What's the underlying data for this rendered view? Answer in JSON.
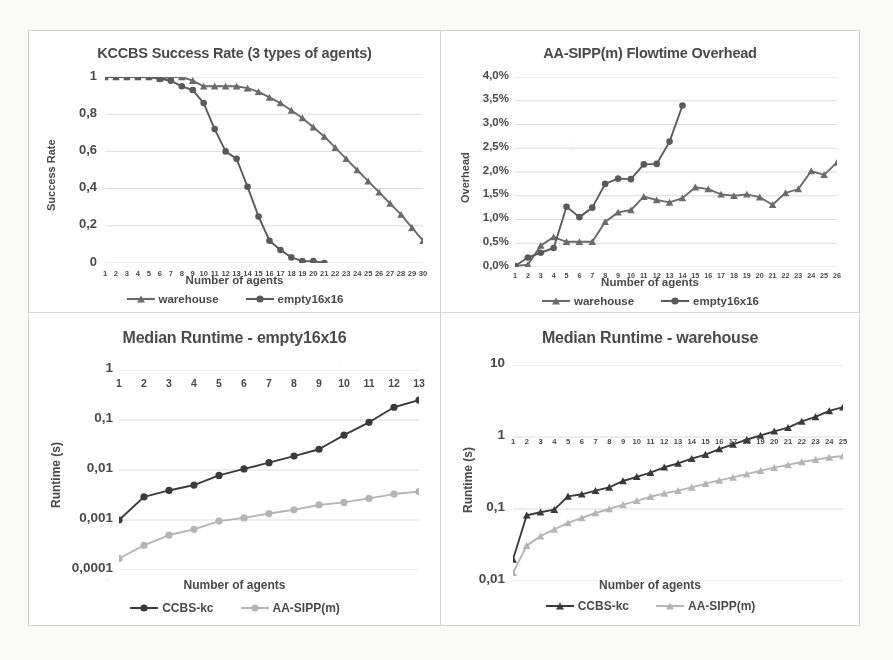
{
  "figure": {
    "background": "#fbfbfa",
    "panel_background": "#ffffff",
    "border_color": "#d2d2d2",
    "text_color": "#4a4a4a"
  },
  "series_colors": {
    "warehouse": "#6b6b6b",
    "empty16x16": "#5a5a5a",
    "ccbs_kc": "#3a3a3a",
    "aa_sipp_m": "#b5b5b5"
  },
  "charts": [
    {
      "id": "kccbs-success-rate",
      "title": "KCCBS Success Rate (3 types of agents)",
      "xlabel": "Number of agents",
      "ylabel": "Success Rate"
    },
    {
      "id": "aasipp-flowtime-overhead",
      "title": "AA-SIPP(m) Flowtime Overhead",
      "xlabel": "Number of agents",
      "ylabel": "Overhead"
    },
    {
      "id": "median-runtime-empty",
      "title": "Median Runtime - empty16x16",
      "xlabel": "Number of agents",
      "ylabel": "Runtime (s)"
    },
    {
      "id": "median-runtime-warehouse",
      "title": "Median Runtime - warehouse",
      "xlabel": "Number of agents",
      "ylabel": "Runtime (s)"
    }
  ],
  "chart_data": [
    {
      "type": "line",
      "id": "kccbs-success-rate",
      "title": "KCCBS Success Rate (3 types of agents)",
      "xlabel": "Number of agents",
      "ylabel": "Success Rate",
      "grid": true,
      "legend_position": "bottom",
      "xlim": [
        1,
        30
      ],
      "ylim": [
        0,
        1
      ],
      "yticks": [
        0,
        0.2,
        0.4,
        0.6,
        0.8,
        1
      ],
      "ytick_labels": [
        "0",
        "0,2",
        "0,4",
        "0,6",
        "0,8",
        "1"
      ],
      "categories": [
        1,
        2,
        3,
        4,
        5,
        6,
        7,
        8,
        9,
        10,
        11,
        12,
        13,
        14,
        15,
        16,
        17,
        18,
        19,
        20,
        21,
        22,
        23,
        24,
        25,
        26,
        27,
        28,
        29,
        30
      ],
      "series": [
        {
          "name": "warehouse",
          "marker": "triangle",
          "color": "#6b6b6b",
          "x": [
            1,
            2,
            3,
            4,
            5,
            6,
            7,
            8,
            9,
            10,
            11,
            12,
            13,
            14,
            15,
            16,
            17,
            18,
            19,
            20,
            21,
            22,
            23,
            24,
            25,
            26,
            27,
            28,
            29,
            30
          ],
          "values": [
            1.0,
            1.0,
            1.0,
            1.0,
            1.0,
            0.99,
            1.0,
            1.0,
            0.98,
            0.95,
            0.95,
            0.95,
            0.95,
            0.94,
            0.92,
            0.89,
            0.86,
            0.82,
            0.78,
            0.73,
            0.68,
            0.62,
            0.56,
            0.5,
            0.44,
            0.38,
            0.32,
            0.26,
            0.19,
            0.12
          ]
        },
        {
          "name": "empty16x16",
          "marker": "circle",
          "color": "#5a5a5a",
          "x": [
            1,
            2,
            3,
            4,
            5,
            6,
            7,
            8,
            9,
            10,
            11,
            12,
            13,
            14,
            15,
            16,
            17,
            18,
            19,
            20,
            21
          ],
          "values": [
            1.0,
            1.0,
            1.0,
            1.0,
            1.0,
            0.99,
            0.98,
            0.95,
            0.93,
            0.86,
            0.72,
            0.6,
            0.56,
            0.41,
            0.25,
            0.12,
            0.07,
            0.03,
            0.01,
            0.01,
            0.0
          ]
        }
      ]
    },
    {
      "type": "line",
      "id": "aasipp-flowtime-overhead",
      "title": "AA-SIPP(m) Flowtime Overhead",
      "xlabel": "Number of agents",
      "ylabel": "Overhead",
      "grid": true,
      "legend_position": "bottom",
      "xlim": [
        1,
        26
      ],
      "ylim": [
        0,
        4
      ],
      "yticks": [
        0,
        0.5,
        1.0,
        1.5,
        2.0,
        2.5,
        3.0,
        3.5,
        4.0
      ],
      "ytick_labels": [
        "0,0%",
        "0,5%",
        "1,0%",
        "1,5%",
        "2,0%",
        "2,5%",
        "3,0%",
        "3,5%",
        "4,0%"
      ],
      "unit": "%",
      "categories": [
        1,
        2,
        3,
        4,
        5,
        6,
        7,
        8,
        9,
        10,
        11,
        12,
        13,
        14,
        15,
        16,
        17,
        18,
        19,
        20,
        21,
        22,
        23,
        24,
        25,
        26
      ],
      "series": [
        {
          "name": "warehouse",
          "marker": "triangle",
          "color": "#6b6b6b",
          "x": [
            1,
            2,
            3,
            4,
            5,
            6,
            7,
            8,
            9,
            10,
            11,
            12,
            13,
            14,
            15,
            16,
            17,
            18,
            19,
            20,
            21,
            22,
            23,
            24,
            25,
            26
          ],
          "values": [
            0.02,
            0.05,
            0.45,
            0.63,
            0.53,
            0.53,
            0.53,
            0.95,
            1.15,
            1.2,
            1.48,
            1.41,
            1.36,
            1.45,
            1.68,
            1.64,
            1.53,
            1.5,
            1.53,
            1.47,
            1.31,
            1.56,
            1.64,
            2.02,
            1.94,
            2.2
          ]
        },
        {
          "name": "empty16x16",
          "marker": "circle",
          "color": "#5a5a5a",
          "x": [
            1,
            2,
            3,
            4,
            5,
            6,
            7,
            8,
            9,
            10,
            11,
            12,
            13,
            14
          ],
          "values": [
            0.02,
            0.2,
            0.3,
            0.4,
            1.27,
            1.05,
            1.25,
            1.75,
            1.86,
            1.85,
            2.16,
            2.17,
            2.64,
            3.4
          ]
        }
      ]
    },
    {
      "type": "line",
      "id": "median-runtime-empty",
      "title": "Median Runtime - empty16x16",
      "xlabel": "Number of agents",
      "ylabel": "Runtime (s)",
      "yscale": "log",
      "grid": true,
      "legend_position": "bottom",
      "xlim": [
        1,
        13
      ],
      "ylim": [
        0.0001,
        1
      ],
      "yticks": [
        0.0001,
        0.001,
        0.01,
        0.1,
        1
      ],
      "ytick_labels": [
        "0,0001",
        "0,001",
        "0,01",
        "0,1",
        "1"
      ],
      "categories": [
        1,
        2,
        3,
        4,
        5,
        6,
        7,
        8,
        9,
        10,
        11,
        12,
        13
      ],
      "series": [
        {
          "name": "CCBS-kc",
          "marker": "circle",
          "color": "#3a3a3a",
          "x": [
            1,
            2,
            3,
            4,
            5,
            6,
            7,
            8,
            9,
            10,
            11,
            12,
            13
          ],
          "values": [
            0.001,
            0.0029,
            0.0039,
            0.005,
            0.0078,
            0.0105,
            0.014,
            0.019,
            0.026,
            0.05,
            0.09,
            0.18,
            0.25
          ]
        },
        {
          "name": "AA-SIPP(m)",
          "marker": "circle",
          "color": "#b5b5b5",
          "x": [
            1,
            2,
            3,
            4,
            5,
            6,
            7,
            8,
            9,
            10,
            11,
            12,
            13
          ],
          "values": [
            0.00017,
            0.00031,
            0.0005,
            0.00065,
            0.00095,
            0.0011,
            0.00135,
            0.0016,
            0.002,
            0.00225,
            0.0027,
            0.0033,
            0.0037
          ]
        }
      ]
    },
    {
      "type": "line",
      "id": "median-runtime-warehouse",
      "title": "Median Runtime - warehouse",
      "xlabel": "Number of agents",
      "ylabel": "Runtime (s)",
      "yscale": "log",
      "grid": true,
      "legend_position": "bottom",
      "xlim": [
        1,
        25
      ],
      "ylim": [
        0.01,
        10
      ],
      "yticks": [
        0.01,
        0.1,
        1,
        10
      ],
      "ytick_labels": [
        "0,01",
        "0,1",
        "1",
        "10"
      ],
      "categories": [
        1,
        2,
        3,
        4,
        5,
        6,
        7,
        8,
        9,
        10,
        11,
        12,
        13,
        14,
        15,
        16,
        17,
        18,
        19,
        20,
        21,
        22,
        23,
        24,
        25
      ],
      "series": [
        {
          "name": "CCBS-kc",
          "marker": "triangle",
          "color": "#3a3a3a",
          "x": [
            1,
            2,
            3,
            4,
            5,
            6,
            7,
            8,
            9,
            10,
            11,
            12,
            13,
            14,
            15,
            16,
            17,
            18,
            19,
            20,
            21,
            22,
            23,
            24,
            25
          ],
          "values": [
            0.02,
            0.082,
            0.09,
            0.098,
            0.15,
            0.16,
            0.18,
            0.2,
            0.245,
            0.28,
            0.32,
            0.38,
            0.43,
            0.5,
            0.57,
            0.68,
            0.79,
            0.92,
            1.05,
            1.2,
            1.35,
            1.65,
            1.9,
            2.3,
            2.6
          ]
        },
        {
          "name": "AA-SIPP(m)",
          "marker": "triangle",
          "color": "#b5b5b5",
          "x": [
            1,
            2,
            3,
            4,
            5,
            6,
            7,
            8,
            9,
            10,
            11,
            12,
            13,
            14,
            15,
            16,
            17,
            18,
            19,
            20,
            21,
            22,
            23,
            24,
            25
          ],
          "values": [
            0.013,
            0.031,
            0.042,
            0.052,
            0.064,
            0.075,
            0.088,
            0.1,
            0.115,
            0.13,
            0.148,
            0.165,
            0.18,
            0.2,
            0.225,
            0.25,
            0.275,
            0.305,
            0.34,
            0.375,
            0.41,
            0.45,
            0.485,
            0.52,
            0.545
          ]
        }
      ]
    }
  ],
  "legends": [
    {
      "chart": "kccbs-success-rate",
      "items": [
        {
          "label": "warehouse",
          "marker": "triangle",
          "color": "#6b6b6b"
        },
        {
          "label": "empty16x16",
          "marker": "circle",
          "color": "#5a5a5a"
        }
      ]
    },
    {
      "chart": "aasipp-flowtime-overhead",
      "items": [
        {
          "label": "warehouse",
          "marker": "triangle",
          "color": "#6b6b6b"
        },
        {
          "label": "empty16x16",
          "marker": "circle",
          "color": "#5a5a5a"
        }
      ]
    },
    {
      "chart": "median-runtime-empty",
      "items": [
        {
          "label": "CCBS-kc",
          "marker": "circle",
          "color": "#3a3a3a"
        },
        {
          "label": "AA-SIPP(m)",
          "marker": "circle",
          "color": "#b5b5b5"
        }
      ]
    },
    {
      "chart": "median-runtime-warehouse",
      "items": [
        {
          "label": "CCBS-kc",
          "marker": "triangle",
          "color": "#3a3a3a"
        },
        {
          "label": "AA-SIPP(m)",
          "marker": "triangle",
          "color": "#b5b5b5"
        }
      ]
    }
  ]
}
